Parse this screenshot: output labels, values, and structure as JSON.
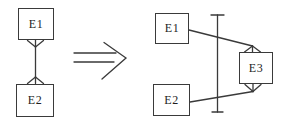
{
  "diagram": {
    "title": "",
    "left_model": {
      "entities": [
        {
          "label": "E1"
        },
        {
          "label": "E2"
        }
      ],
      "relationship": {
        "type": "many-to-many",
        "notation": "crows-foot",
        "ends": [
          "crow-foot-at-E1",
          "crow-foot-at-E2"
        ]
      }
    },
    "arrow": {
      "icon": "double-right-arrow",
      "glyph": "⇒"
    },
    "right_model": {
      "entities": [
        {
          "label": "E1"
        },
        {
          "label": "E2"
        },
        {
          "label": "E3"
        }
      ],
      "relationships": [
        {
          "from": "E1",
          "to": "E3",
          "end": "crow-foot-at-E3-top"
        },
        {
          "from": "E2",
          "to": "E3",
          "end": "crow-foot-at-E3-bottom"
        }
      ],
      "constraint_bar": "vertical-line-with-end-caps"
    },
    "colors": {
      "stroke": "#3a3a3a",
      "entity_border": "#3a3a3a",
      "text": "#1e1e1e",
      "background": "#ffffff"
    }
  }
}
